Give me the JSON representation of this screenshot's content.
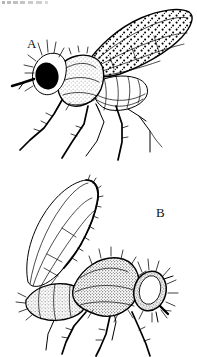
{
  "plate": {
    "kind": "scientific-illustration",
    "medium": "scanned black-and-white line drawing",
    "subject": "two flies shown in lateral view",
    "background_color": "#ffffff",
    "ink_color": "#000000",
    "width_px": 197,
    "height_px": 357,
    "border": "none",
    "artifact": {
      "name": "scan-noise-smudge",
      "description": "faint illegible grey smudge of degraded text along the top-left edge",
      "color": "#7a7a80"
    }
  },
  "figures": [
    {
      "id": "A",
      "label": "A",
      "label_x": 27,
      "label_y": 37,
      "facing": "left",
      "wing": "elongate, densely stippled with dark spots, longitudinal veins visible",
      "eye": "large, solid black",
      "body": "lightly stippled thorax, banded segmented abdomen",
      "legs": 6
    },
    {
      "id": "B",
      "label": "B",
      "label_x": 156,
      "label_y": 206,
      "facing": "right",
      "wing": "hyaline (clear), unspotted, dark costal margin with fringe, longitudinal veins visible",
      "eye": "outlined, unfilled, ringed with bristles",
      "body": "densely stippled / pubescent thorax and abdomen",
      "legs": 6
    }
  ]
}
